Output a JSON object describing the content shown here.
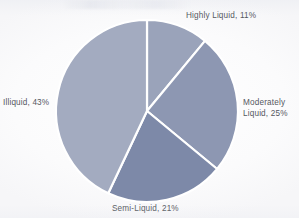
{
  "figure": {
    "background_color": "#fdfdfd",
    "label_color": "#55585f",
    "slice_gap_color": "#ffffff"
  },
  "chart_data": {
    "type": "pie",
    "title": "",
    "xlabel": "",
    "ylabel": "",
    "legend_position": "none",
    "grid": false,
    "start_angle_deg": 0,
    "direction": "clockwise",
    "center": [
      147,
      111
    ],
    "radius": 91,
    "categories": [
      "Highly Liquid",
      "Moderately Liquid",
      "Semi-Liquid",
      "Illiquid"
    ],
    "values": [
      11,
      25,
      21,
      43
    ],
    "units": "percent",
    "colors": [
      "#9aa3ba",
      "#8d97b2",
      "#7d89a8",
      "#a3abc0"
    ],
    "slices": [
      {
        "label": "Highly Liquid",
        "value": 11,
        "value_text": "11%",
        "label_text": "Highly Liquid, 11%",
        "color": "#9aa3ba",
        "start_deg": 0,
        "end_deg": 39.6,
        "label_position": "top-right"
      },
      {
        "label": "Moderately Liquid",
        "value": 25,
        "value_text": "25%",
        "label_text": "Moderately\nLiquid, 25%",
        "color": "#8d97b2",
        "start_deg": 39.6,
        "end_deg": 129.6,
        "label_position": "right"
      },
      {
        "label": "Semi-Liquid",
        "value": 21,
        "value_text": "21%",
        "label_text": "Semi-Liquid, 21%",
        "color": "#7d89a8",
        "start_deg": 129.6,
        "end_deg": 205.2,
        "label_position": "bottom"
      },
      {
        "label": "Illiquid",
        "value": 43,
        "value_text": "43%",
        "label_text": "Illiquid, 43%",
        "color": "#a3abc0",
        "start_deg": 205.2,
        "end_deg": 360,
        "label_position": "left"
      }
    ]
  }
}
